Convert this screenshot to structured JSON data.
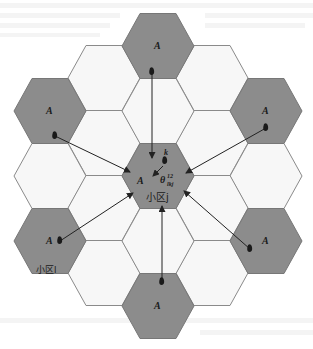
{
  "diagram": {
    "hex": {
      "width": 72,
      "height": 65,
      "col_step": 54,
      "row_step": 65
    },
    "colors": {
      "interfering_cell": "#8c8c8c",
      "normal_cell": "#f7f7f7",
      "edge": "#8a8a8a",
      "arrow": "#222222"
    },
    "target_cell": {
      "center": [
        158,
        176
      ],
      "label_A": "A",
      "name": "小区j",
      "user_label": "k",
      "angle_label": "θ",
      "angle_sup": "12",
      "angle_sub": "lkj"
    },
    "interfering_cells": [
      {
        "id": "top",
        "center": [
          158,
          46
        ],
        "label": "A"
      },
      {
        "id": "upper-right",
        "center": [
          266,
          111
        ],
        "label": "A"
      },
      {
        "id": "lower-right",
        "center": [
          266,
          241
        ],
        "label": "A"
      },
      {
        "id": "bottom",
        "center": [
          158,
          306
        ],
        "label": "A"
      },
      {
        "id": "lower-left",
        "center": [
          50,
          241
        ],
        "label": "A",
        "name": "小区l"
      },
      {
        "id": "upper-left",
        "center": [
          50,
          111
        ],
        "label": "A"
      }
    ],
    "normal_cells": [
      [
        104,
        78
      ],
      [
        212,
        78
      ],
      [
        104,
        143
      ],
      [
        212,
        143
      ],
      [
        50,
        176
      ],
      [
        266,
        176
      ],
      [
        104,
        208
      ],
      [
        212,
        208
      ],
      [
        104,
        273
      ],
      [
        212,
        273
      ],
      [
        158,
        111
      ],
      [
        158,
        241
      ]
    ]
  }
}
